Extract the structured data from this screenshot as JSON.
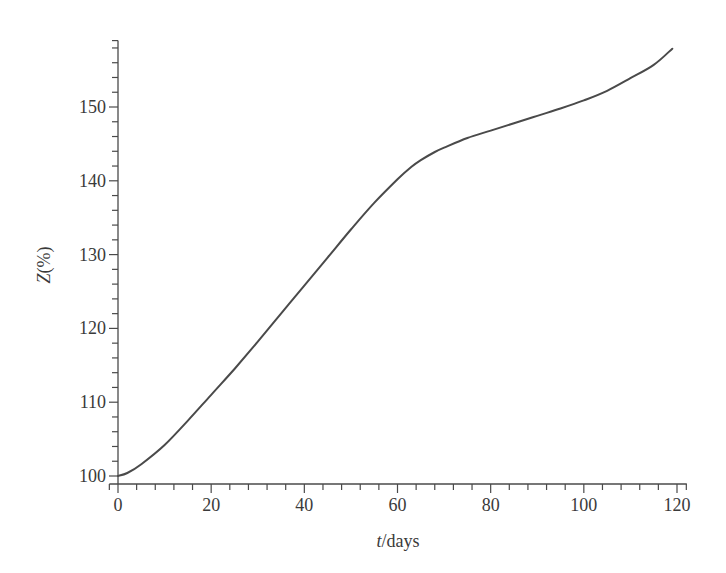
{
  "chart_data": {
    "type": "line",
    "title": "",
    "xlabel": "t/days",
    "xlabel_italic_part": "t",
    "xlabel_rest": "/days",
    "ylabel": "Z(%)",
    "ylabel_italic_part": "Z",
    "ylabel_rest": "(%)",
    "xlim": [
      -1,
      122
    ],
    "ylim": [
      99,
      159
    ],
    "x_ticks": [
      0,
      20,
      40,
      60,
      80,
      100,
      120
    ],
    "x_minor_step": 4,
    "y_ticks": [
      100,
      110,
      120,
      130,
      140,
      150
    ],
    "y_minor_step": 2,
    "grid": false,
    "legend": null,
    "series": [
      {
        "name": "Z",
        "color": "#4a4a4a",
        "x": [
          0,
          2,
          5,
          10,
          15,
          20,
          25,
          30,
          35,
          40,
          45,
          50,
          55,
          60,
          63,
          65,
          68,
          70,
          75,
          80,
          85,
          90,
          95,
          100,
          105,
          110,
          115,
          119
        ],
        "y": [
          100,
          100.4,
          101.6,
          104.2,
          107.5,
          111.0,
          114.5,
          118.2,
          122.0,
          125.8,
          129.6,
          133.4,
          137.0,
          140.2,
          141.9,
          142.8,
          143.9,
          144.5,
          145.8,
          146.8,
          147.8,
          148.8,
          149.8,
          150.9,
          152.2,
          153.9,
          155.7,
          157.9
        ]
      }
    ]
  }
}
